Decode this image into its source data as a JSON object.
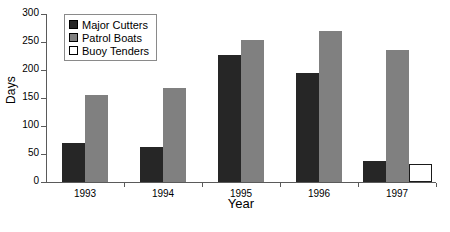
{
  "chart_data": {
    "type": "bar",
    "title": "",
    "xlabel": "Year",
    "ylabel": "Days",
    "categories": [
      "1993",
      "1994",
      "1995",
      "1996",
      "1997"
    ],
    "series": [
      {
        "name": "Major Cutters",
        "color": "#262626",
        "values": [
          70,
          63,
          226,
          195,
          38
        ]
      },
      {
        "name": "Patrol Boats",
        "color": "#808080",
        "values": [
          155,
          168,
          254,
          270,
          236
        ]
      },
      {
        "name": "Buoy Tenders",
        "color": "#ffffff",
        "values": [
          null,
          null,
          null,
          null,
          32
        ]
      }
    ],
    "ylim": [
      0,
      300
    ],
    "yticks": [
      0,
      50,
      100,
      150,
      200,
      250,
      300
    ],
    "ytick_labels": [
      "0",
      "50",
      "100",
      "150",
      "200",
      "250",
      "300"
    ],
    "grid": false,
    "legend_position": "top-left-inside"
  },
  "axes": {
    "y_title": "Days",
    "x_title": "Year"
  },
  "legend": {
    "items": [
      {
        "label": "Major Cutters"
      },
      {
        "label": "Patrol Boats"
      },
      {
        "label": "Buoy Tenders"
      }
    ]
  }
}
